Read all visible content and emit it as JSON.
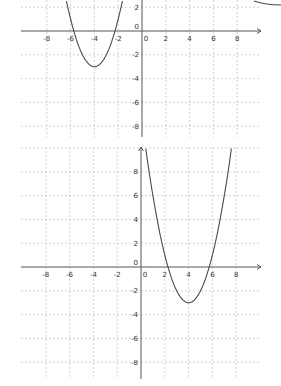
{
  "chart_data": [
    {
      "type": "line",
      "title": "",
      "xlabel": "x",
      "ylabel": "y",
      "xlim": [
        -10,
        10
      ],
      "ylim": [
        -9,
        2.5
      ],
      "grid": true,
      "x_ticks": [
        "-8",
        "-6",
        "-4",
        "-2",
        "0",
        "2",
        "4",
        "6",
        "8"
      ],
      "y_ticks": [
        "2",
        "0",
        "-2",
        "-4",
        "-6",
        "-8"
      ],
      "series": [
        {
          "name": "y = (x+4)^2 - 3",
          "vertex": [
            -4,
            -3
          ],
          "roots": [
            -5.73,
            -2.27
          ],
          "x": [
            -6.5,
            -6,
            -5.5,
            -5,
            -4.5,
            -4,
            -3.5,
            -3,
            -2.5,
            -2,
            -1.5
          ],
          "y": [
            3.25,
            1,
            -0.75,
            -2,
            -2.75,
            -3,
            -2.75,
            -2,
            -0.75,
            1,
            3.25
          ]
        }
      ]
    },
    {
      "type": "line",
      "title": "",
      "xlabel": "x",
      "ylabel": "y",
      "xlim": [
        -10,
        10
      ],
      "ylim": [
        -9.5,
        10
      ],
      "grid": true,
      "x_ticks": [
        "-8",
        "-6",
        "-4",
        "-2",
        "0",
        "2",
        "4",
        "6",
        "8"
      ],
      "y_ticks": [
        "8",
        "6",
        "4",
        "2",
        "0",
        "-2",
        "-4",
        "-6",
        "-8"
      ],
      "series": [
        {
          "name": "y = (x-4)^2 - 3",
          "vertex": [
            4,
            -3
          ],
          "roots": [
            2.27,
            5.73
          ],
          "x": [
            0.4,
            1,
            2,
            3,
            4,
            5,
            6,
            7,
            7.6
          ],
          "y": [
            10,
            6,
            1,
            -2,
            -3,
            -2,
            1,
            6,
            10
          ]
        }
      ]
    }
  ]
}
